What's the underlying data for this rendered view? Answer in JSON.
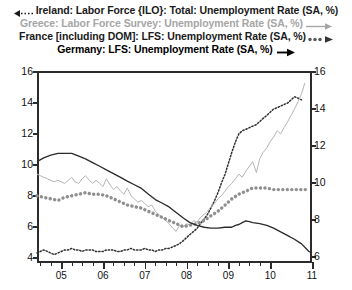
{
  "legend": {
    "items": [
      {
        "label": "Ireland: Labor Force {ILO}: Total: Unemployment Rate (SA, %)",
        "marker": "left-arrow-dotted",
        "color": "#1a1a1a",
        "axis": "left"
      },
      {
        "label": "Greece: Labor Force Survey: Unemployment Rate (SA, %)",
        "marker": "right-arrow-solid-thin",
        "color": "#a6a6a6",
        "axis": "left"
      },
      {
        "label": "France [including DOM]: LFS: Unemployment Rate (SA, %)",
        "marker": "right-arrow-thick-dotted",
        "color": "#8c8c8c",
        "axis": "left"
      },
      {
        "label": "Germany: LFS: Unemployment Rate (SA, %)",
        "marker": "right-arrow-solid",
        "color": "#2b2b2b",
        "axis": "right"
      }
    ]
  },
  "axes": {
    "left_ticks": [
      "4",
      "6",
      "8",
      "10",
      "12",
      "14",
      "16"
    ],
    "right_ticks": [
      "6",
      "8",
      "10",
      "12",
      "14",
      "16"
    ],
    "x_ticks": [
      "05",
      "06",
      "07",
      "08",
      "09",
      "10",
      "11"
    ],
    "left_range": [
      3.72,
      16
    ],
    "right_range": [
      5.72,
      16
    ],
    "x_range": [
      2004.42,
      2011.0
    ]
  },
  "chart_data": {
    "type": "line",
    "title": "",
    "xlabel": "",
    "ylabel": "",
    "grid": false,
    "legend_position": "top",
    "left_axis": {
      "label": "Unemployment Rate (SA, %)",
      "ylim": [
        3.72,
        16
      ]
    },
    "right_axis": {
      "label": "Unemployment Rate (SA, %)",
      "ylim": [
        5.72,
        16
      ]
    },
    "xlim": [
      2004.42,
      2011.0
    ],
    "x_tick_labels": [
      "05",
      "06",
      "07",
      "08",
      "09",
      "10",
      "11"
    ],
    "series": [
      {
        "name": "Ireland: Labor Force {ILO}: Total: Unemployment Rate (SA, %)",
        "axis": "left",
        "style": "dotted-thin",
        "color": "#303030",
        "x": [
          2004.42,
          2004.5,
          2004.58,
          2004.67,
          2004.75,
          2004.83,
          2004.92,
          2005.0,
          2005.08,
          2005.17,
          2005.25,
          2005.33,
          2005.42,
          2005.5,
          2005.58,
          2005.67,
          2005.75,
          2005.83,
          2005.92,
          2006.0,
          2006.08,
          2006.17,
          2006.25,
          2006.33,
          2006.42,
          2006.5,
          2006.58,
          2006.67,
          2006.75,
          2006.83,
          2006.92,
          2007.0,
          2007.08,
          2007.17,
          2007.25,
          2007.33,
          2007.42,
          2007.5,
          2007.58,
          2007.67,
          2007.75,
          2007.83,
          2007.92,
          2008.0,
          2008.08,
          2008.17,
          2008.25,
          2008.33,
          2008.42,
          2008.5,
          2008.58,
          2008.67,
          2008.75,
          2008.83,
          2008.92,
          2009.0,
          2009.08,
          2009.17,
          2009.25,
          2009.33,
          2009.42,
          2009.5,
          2009.58,
          2009.67,
          2009.75,
          2009.83,
          2009.92,
          2010.0,
          2010.08,
          2010.17,
          2010.25,
          2010.33,
          2010.42,
          2010.5,
          2010.58,
          2010.67,
          2010.75
        ],
        "values": [
          4.3,
          4.4,
          4.5,
          4.4,
          4.3,
          4.2,
          4.3,
          4.4,
          4.5,
          4.5,
          4.6,
          4.5,
          4.5,
          4.4,
          4.5,
          4.5,
          4.5,
          4.4,
          4.4,
          4.4,
          4.5,
          4.5,
          4.5,
          4.4,
          4.4,
          4.5,
          4.5,
          4.6,
          4.5,
          4.5,
          4.5,
          4.6,
          4.5,
          4.5,
          4.4,
          4.5,
          4.5,
          4.6,
          4.6,
          4.7,
          4.8,
          4.9,
          5.1,
          5.3,
          5.5,
          5.7,
          5.9,
          6.2,
          6.5,
          6.8,
          7.2,
          7.7,
          8.2,
          8.8,
          9.4,
          10.1,
          10.8,
          11.5,
          12.0,
          12.2,
          12.3,
          12.4,
          12.5,
          12.6,
          12.8,
          13.0,
          13.2,
          13.4,
          13.6,
          13.7,
          13.8,
          13.9,
          14.0,
          14.2,
          14.4,
          14.3,
          14.2
        ]
      },
      {
        "name": "Greece: Labor Force Survey: Unemployment Rate (SA, %)",
        "axis": "left",
        "style": "solid-thin",
        "color": "#b5b5b5",
        "x": [
          2004.42,
          2004.5,
          2004.58,
          2004.67,
          2004.75,
          2004.83,
          2004.92,
          2005.0,
          2005.08,
          2005.17,
          2005.25,
          2005.33,
          2005.42,
          2005.5,
          2005.58,
          2005.67,
          2005.75,
          2005.83,
          2005.92,
          2006.0,
          2006.08,
          2006.17,
          2006.25,
          2006.33,
          2006.42,
          2006.5,
          2006.58,
          2006.67,
          2006.75,
          2006.83,
          2006.92,
          2007.0,
          2007.08,
          2007.17,
          2007.25,
          2007.33,
          2007.42,
          2007.5,
          2007.58,
          2007.67,
          2007.75,
          2007.83,
          2007.92,
          2008.0,
          2008.08,
          2008.17,
          2008.25,
          2008.33,
          2008.42,
          2008.5,
          2008.58,
          2008.67,
          2008.75,
          2008.83,
          2008.92,
          2009.0,
          2009.08,
          2009.17,
          2009.25,
          2009.33,
          2009.42,
          2009.5,
          2009.58,
          2009.67,
          2009.75,
          2009.83,
          2009.92,
          2010.0,
          2010.08,
          2010.17,
          2010.25,
          2010.33,
          2010.42,
          2010.5,
          2010.58,
          2010.67,
          2010.75,
          2010.83
        ],
        "values": [
          9.4,
          9.3,
          9.2,
          9.1,
          9.0,
          8.9,
          9.0,
          8.9,
          8.8,
          9.0,
          9.2,
          8.9,
          8.8,
          9.1,
          9.3,
          9.0,
          8.8,
          9.0,
          8.8,
          8.6,
          9.1,
          8.7,
          8.4,
          8.6,
          8.3,
          8.1,
          8.5,
          8.0,
          7.8,
          7.6,
          7.7,
          7.5,
          7.3,
          7.4,
          7.0,
          6.8,
          6.6,
          6.4,
          6.2,
          5.9,
          5.7,
          6.1,
          6.0,
          6.2,
          6.1,
          6.4,
          6.3,
          6.6,
          6.8,
          7.0,
          7.3,
          7.5,
          7.8,
          8.0,
          8.3,
          8.6,
          8.8,
          9.1,
          9.4,
          9.2,
          9.6,
          9.9,
          10.2,
          9.5,
          10.4,
          10.8,
          11.1,
          11.5,
          11.8,
          12.2,
          12.0,
          12.4,
          12.8,
          13.2,
          13.6,
          14.1,
          14.6,
          15.3
        ]
      },
      {
        "name": "France [including DOM]: LFS: Unemployment Rate (SA, %)",
        "axis": "left",
        "style": "dotted-thick",
        "color": "#8f8f8f",
        "x": [
          2004.42,
          2004.58,
          2004.75,
          2004.92,
          2005.08,
          2005.25,
          2005.42,
          2005.58,
          2005.75,
          2005.92,
          2006.08,
          2006.25,
          2006.42,
          2006.58,
          2006.75,
          2006.92,
          2007.08,
          2007.25,
          2007.42,
          2007.58,
          2007.75,
          2007.92,
          2008.08,
          2008.25,
          2008.42,
          2008.58,
          2008.75,
          2008.92,
          2009.08,
          2009.25,
          2009.42,
          2009.58,
          2009.75,
          2009.92,
          2010.08,
          2010.25,
          2010.42,
          2010.58,
          2010.75,
          2010.92
        ],
        "values": [
          8.0,
          7.9,
          7.8,
          7.7,
          7.9,
          8.0,
          8.1,
          8.2,
          8.1,
          8.1,
          8.0,
          7.8,
          7.6,
          7.4,
          7.3,
          7.2,
          7.0,
          6.8,
          6.6,
          6.4,
          6.2,
          6.0,
          6.1,
          6.2,
          6.4,
          6.7,
          7.0,
          7.4,
          7.8,
          8.1,
          8.3,
          8.5,
          8.5,
          8.5,
          8.4,
          8.4,
          8.4,
          8.4,
          8.4,
          8.4
        ]
      },
      {
        "name": "Germany: LFS: Unemployment Rate (SA, %)",
        "axis": "right",
        "style": "solid",
        "color": "#2b2b2b",
        "x": [
          2004.42,
          2004.58,
          2004.75,
          2004.92,
          2005.08,
          2005.25,
          2005.42,
          2005.58,
          2005.75,
          2005.92,
          2006.08,
          2006.25,
          2006.42,
          2006.58,
          2006.75,
          2006.92,
          2007.08,
          2007.25,
          2007.42,
          2007.58,
          2007.75,
          2007.92,
          2008.08,
          2008.25,
          2008.42,
          2008.58,
          2008.75,
          2008.92,
          2009.0,
          2009.08,
          2009.17,
          2009.25,
          2009.33,
          2009.42,
          2009.5,
          2009.58,
          2009.75,
          2009.92,
          2010.08,
          2010.25,
          2010.42,
          2010.58,
          2010.75,
          2010.92,
          2011.0
        ],
        "values": [
          11.15,
          11.35,
          11.5,
          11.6,
          11.6,
          11.6,
          11.45,
          11.3,
          11.1,
          10.9,
          10.7,
          10.5,
          10.3,
          10.1,
          9.9,
          9.7,
          9.4,
          9.1,
          8.9,
          8.7,
          8.4,
          8.1,
          7.85,
          7.7,
          7.6,
          7.55,
          7.55,
          7.6,
          7.6,
          7.6,
          7.7,
          7.75,
          7.85,
          7.95,
          7.9,
          7.85,
          7.8,
          7.7,
          7.55,
          7.35,
          7.15,
          6.95,
          6.7,
          6.3,
          6.2
        ]
      }
    ]
  }
}
